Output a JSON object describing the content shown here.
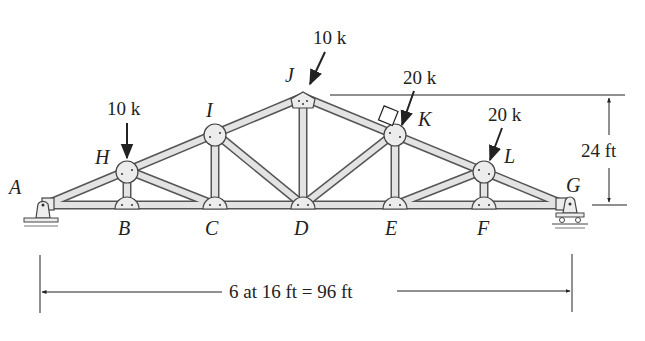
{
  "figure": {
    "type": "truss diagram",
    "joints": {
      "A": "A",
      "B": "B",
      "C": "C",
      "D": "D",
      "E": "E",
      "F": "F",
      "G": "G",
      "H": "H",
      "I": "I",
      "J": "J",
      "K": "K",
      "L": "L"
    },
    "loads": [
      {
        "joint": "H",
        "label": "10 k",
        "direction": "vertical"
      },
      {
        "joint": "J",
        "label": "10 k",
        "direction": "inclined"
      },
      {
        "joint": "K",
        "label": "20 k",
        "direction": "normal to top chord"
      },
      {
        "joint": "L",
        "label": "20 k",
        "direction": "inclined"
      }
    ],
    "dimensions": {
      "height": "24 ft",
      "span": "6 at 16 ft = 96 ft"
    },
    "supports": {
      "left": "pin at A",
      "right": "roller at G"
    }
  }
}
